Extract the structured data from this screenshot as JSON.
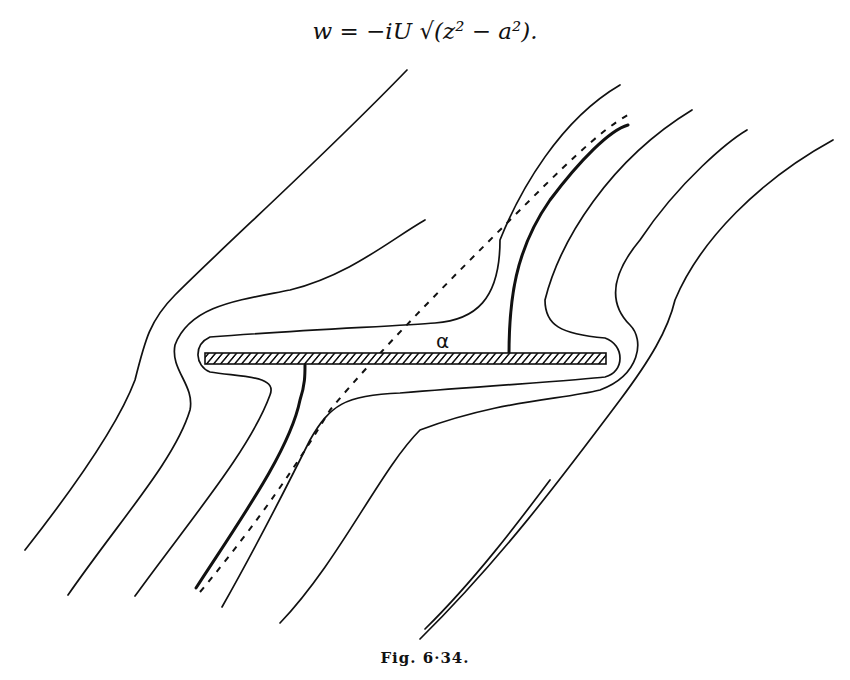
{
  "equation": {
    "text": "w = −iU √(z² − a²)."
  },
  "figure": {
    "angle_label": "α",
    "caption": "Fig. 6·34.",
    "elements": [
      {
        "name": "flat-plate",
        "type": "hatched-bar"
      },
      {
        "name": "dividing-streamline-upper",
        "type": "heavy-line"
      },
      {
        "name": "dividing-streamline-lower",
        "type": "heavy-line"
      },
      {
        "name": "flow-direction-line",
        "type": "dashed-line"
      },
      {
        "name": "streamlines",
        "count": 10
      }
    ]
  }
}
